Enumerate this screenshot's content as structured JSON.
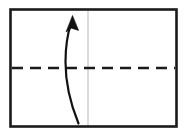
{
  "figure": {
    "type": "line-diagram",
    "canvas": {
      "width": 187,
      "height": 136,
      "background": "#ffffff"
    },
    "frame": {
      "name": "rectangular-border",
      "x": 10.5,
      "y": 9.5,
      "width": 166,
      "height": 117,
      "stroke": "#1a1a1a",
      "stroke_width": 2.6,
      "fill": "#ffffff"
    },
    "axis_dashed": {
      "name": "horizontal-dashed-centerline",
      "x1": 12,
      "y1": 68,
      "x2": 175,
      "y2": 68,
      "stroke": "#1a1a1a",
      "stroke_width": 2.4,
      "dash_pattern": "11 7",
      "orientation": "horizontal"
    },
    "axis_vertical": {
      "name": "vertical-reference-line",
      "x1": 88,
      "y1": 11,
      "x2": 88,
      "y2": 125,
      "stroke": "#b8b8b8",
      "stroke_width": 1,
      "orientation": "vertical"
    },
    "arrow": {
      "name": "curved-upward-arrow",
      "stroke": "#111111",
      "stroke_width": 2.2,
      "fill": "#111111",
      "direction": "up",
      "curvature": "bows-left",
      "path": "M 78.5 123.5 C 70.5 104 65.5 84 65.5 62 C 65.5 46 67.5 34 71.0 23.5",
      "tail_point": {
        "x": 78.5,
        "y": 123.5
      },
      "tip_point": {
        "x": 72.5,
        "y": 15.5
      },
      "head_polygon": "72.5,15.5 66.0,32.0 71.4,28.2 78.6,30.4"
    }
  },
  "labels": {
    "alt_text": "Diagram of a curved arrow pointing upward, crossing a dashed horizontal line, inside a rectangular frame with a faint vertical guide line."
  }
}
